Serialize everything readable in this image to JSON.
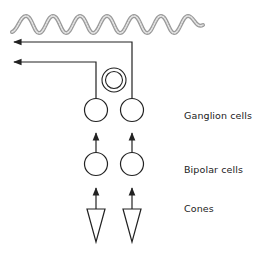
{
  "diagram": {
    "labels": {
      "ganglion": "Ganglion cells",
      "bipolar": "Bipolar cells",
      "cones": "Cones"
    },
    "colors": {
      "line": "#222222",
      "wave": "#8a8a8a",
      "background": "#ffffff"
    },
    "elements": {
      "wave": "light-wave",
      "arrows": [
        "output-arrow-upper",
        "output-arrow-lower"
      ],
      "ganglion_cells": 2,
      "bipolar_cells": 2,
      "cones": 2,
      "extra_cell": "double-ring-cell"
    }
  }
}
